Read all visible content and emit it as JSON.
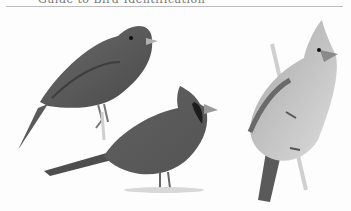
{
  "page": {
    "caption_fragment": "Guide to Bird Identification",
    "palette": {
      "background": "#fdfdfd",
      "dark_bird": "#555555",
      "mid_bird": "#6e6e6e",
      "female_body": "#c9c9c9",
      "beak": "#b0b0b0",
      "rule": "#bcbcbc"
    }
  },
  "illustration": {
    "subject": "Northern Cardinal plumages",
    "figures": [
      {
        "id": "juvenile",
        "position": "upper-left",
        "pose": "perched, facing right"
      },
      {
        "id": "male",
        "position": "lower-center",
        "pose": "standing on ground, crested, black mask, facing right"
      },
      {
        "id": "female",
        "position": "right",
        "pose": "clinging to vertical twig, crested, facing right"
      }
    ]
  }
}
